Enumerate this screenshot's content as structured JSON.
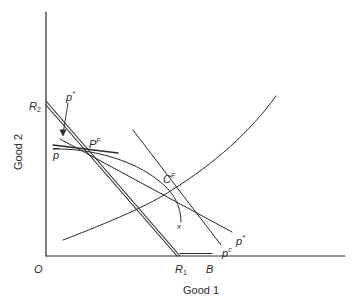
{
  "diagram": {
    "type": "economics trade diagram",
    "axes": {
      "x_label": "Good 1",
      "y_label": "Good 2",
      "origin_label": "O"
    },
    "points": {
      "R2": {
        "base": "R",
        "sub": "2"
      },
      "R1": {
        "base": "R",
        "sub": "1"
      },
      "B": {
        "base": "B"
      },
      "PF": {
        "base": "P",
        "sup": "F"
      },
      "CF": {
        "base": "C",
        "sup": "F"
      }
    },
    "lines": {
      "p_star_top": {
        "base": "p",
        "sup": "*"
      },
      "p_star_right": {
        "base": "p",
        "sup": "*"
      },
      "p_bar": {
        "base": "p"
      },
      "p_c": {
        "base": "p",
        "sup": "c"
      },
      "curve_x": {
        "base": "x"
      }
    },
    "colors": {
      "ink": "#2a2a2a",
      "background": "#ffffff"
    }
  }
}
